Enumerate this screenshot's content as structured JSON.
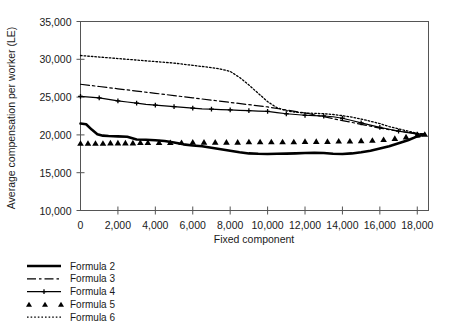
{
  "chart_data": {
    "type": "line",
    "title": "",
    "xlabel": "Fixed component",
    "ylabel": "Average compensation per worker (LE)",
    "xlim": [
      0,
      18600
    ],
    "ylim": [
      10000,
      35000
    ],
    "xticks": [
      0,
      2000,
      4000,
      6000,
      8000,
      10000,
      12000,
      14000,
      16000,
      18000
    ],
    "xtick_labels": [
      "0",
      "2,000",
      "4,000",
      "6,000",
      "8,000",
      "10,000",
      "12,000",
      "14,000",
      "16,000",
      "18,000"
    ],
    "yticks": [
      10000,
      15000,
      20000,
      25000,
      30000,
      35000
    ],
    "ytick_labels": [
      "10,000",
      "15,000",
      "20,000",
      "25,000",
      "30,000",
      "35,000"
    ],
    "grid": false,
    "legend_position": "below-left",
    "series": [
      {
        "name": "Formula 2",
        "style": "solid-thick",
        "marker": "none",
        "color": "#000000",
        "x": [
          0,
          300,
          600,
          900,
          1200,
          1500,
          2000,
          2500,
          3000,
          3500,
          4000,
          4500,
          5000,
          5500,
          6000,
          6500,
          7000,
          7500,
          8000,
          8500,
          9000,
          9500,
          10000,
          10500,
          11000,
          11500,
          12000,
          12500,
          13000,
          13500,
          14000,
          14500,
          15000,
          15500,
          16000,
          16500,
          17000,
          17500,
          18000,
          18400
        ],
        "y": [
          21500,
          21400,
          20700,
          20100,
          19900,
          19850,
          19800,
          19750,
          19400,
          19350,
          19300,
          19200,
          19000,
          18750,
          18600,
          18500,
          18300,
          18100,
          17900,
          17700,
          17550,
          17500,
          17480,
          17500,
          17520,
          17550,
          17600,
          17620,
          17600,
          17500,
          17480,
          17550,
          17700,
          17900,
          18200,
          18500,
          18900,
          19300,
          19800,
          20100
        ]
      },
      {
        "name": "Formula 3",
        "style": "dashed",
        "marker": "none",
        "color": "#000000",
        "x": [
          0,
          1000,
          2000,
          3000,
          4000,
          5000,
          6000,
          7000,
          8000,
          9000,
          10000,
          11000,
          12000,
          13000,
          14000,
          15000,
          16000,
          17000,
          18000,
          18400
        ],
        "y": [
          26700,
          26400,
          26100,
          25800,
          25500,
          25200,
          24900,
          24600,
          24300,
          24000,
          23700,
          23300,
          22900,
          22400,
          21900,
          21400,
          20900,
          20500,
          20200,
          20100
        ]
      },
      {
        "name": "Formula 4",
        "style": "solid-marker",
        "marker": "plus",
        "color": "#000000",
        "x": [
          0,
          500,
          1000,
          1500,
          2000,
          2500,
          3000,
          3500,
          4000,
          4500,
          5000,
          5500,
          6000,
          6500,
          7000,
          7500,
          8000,
          8500,
          9000,
          9500,
          10000,
          10500,
          11000,
          11500,
          12000,
          12500,
          13000,
          13500,
          14000,
          14500,
          15000,
          15500,
          16000,
          16500,
          17000,
          17500,
          18000,
          18400
        ],
        "y": [
          25100,
          25000,
          24900,
          24700,
          24500,
          24350,
          24200,
          24050,
          23950,
          23850,
          23750,
          23650,
          23550,
          23450,
          23400,
          23350,
          23300,
          23250,
          23200,
          23150,
          23100,
          22950,
          22800,
          22700,
          22600,
          22550,
          22500,
          22400,
          22200,
          21900,
          21600,
          21300,
          21000,
          20750,
          20500,
          20300,
          20100,
          20100
        ]
      },
      {
        "name": "Formula 5",
        "style": "markers-only",
        "marker": "triangle",
        "color": "#000000",
        "x": [
          0,
          400,
          800,
          1200,
          1600,
          2000,
          2400,
          2800,
          3200,
          3600,
          4200,
          4800,
          5400,
          6000,
          6600,
          7200,
          7800,
          8400,
          9000,
          9600,
          10200,
          10800,
          11400,
          12000,
          12600,
          13200,
          13800,
          14400,
          15000,
          15600,
          16200,
          16800,
          17400,
          18000,
          18400
        ],
        "y": [
          18900,
          18900,
          18900,
          18900,
          18950,
          18950,
          18950,
          18950,
          19000,
          19000,
          19000,
          19000,
          19000,
          19050,
          19050,
          19050,
          19050,
          19050,
          19100,
          19100,
          19100,
          19100,
          19100,
          19150,
          19150,
          19150,
          19200,
          19200,
          19250,
          19300,
          19400,
          19550,
          19750,
          20000,
          20100
        ]
      },
      {
        "name": "Formula 6",
        "style": "dotted",
        "marker": "none",
        "color": "#000000",
        "x": [
          0,
          1000,
          2000,
          3000,
          4000,
          5000,
          6000,
          7000,
          7500,
          8000,
          8500,
          9000,
          9500,
          10000,
          10500,
          11000,
          11500,
          12000,
          12500,
          13000,
          13500,
          14000,
          14500,
          15000,
          15500,
          16000,
          16500,
          17000,
          17500,
          18000,
          18400
        ],
        "y": [
          30500,
          30300,
          30100,
          29900,
          29700,
          29500,
          29200,
          28900,
          28700,
          28400,
          27600,
          26600,
          25500,
          24400,
          23600,
          23200,
          23000,
          22900,
          22850,
          22800,
          22700,
          22550,
          22350,
          22100,
          21800,
          21500,
          21100,
          20800,
          20500,
          20200,
          20100
        ]
      }
    ]
  },
  "legend": {
    "items": [
      {
        "label": "Formula 2",
        "style": "solid-thick"
      },
      {
        "label": "Formula 3",
        "style": "dashed"
      },
      {
        "label": "Formula 4",
        "style": "solid-marker"
      },
      {
        "label": "Formula 5",
        "style": "markers-only"
      },
      {
        "label": "Formula 6",
        "style": "dotted"
      }
    ]
  },
  "colors": {
    "ink": "#000000",
    "frame": "#555555",
    "background": "#ffffff"
  }
}
